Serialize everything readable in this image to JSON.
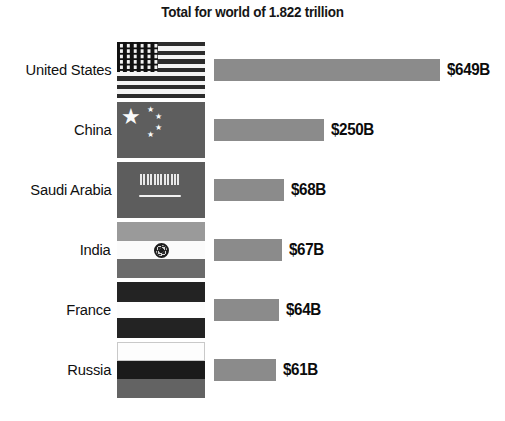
{
  "chart_data": {
    "type": "bar",
    "title": "Total for world of 1.822 trillion",
    "orientation": "horizontal",
    "xlabel": "",
    "ylabel": "",
    "grid": false,
    "legend": "none",
    "unit": "billions of USD",
    "xlim": [
      0,
      649
    ],
    "categories": [
      "United States",
      "China",
      "Saudi Arabia",
      "India",
      "France",
      "Russia"
    ],
    "values": [
      649,
      250,
      68,
      67,
      64,
      61
    ],
    "value_labels": [
      "$649B",
      "$250B",
      "$68B",
      "$67B",
      "$64B",
      "$61B"
    ]
  },
  "title": "Total for world of 1.822 trillion",
  "rows": [
    {
      "country": "United States",
      "value_label": "$649B",
      "value": 649,
      "bar_px": 226,
      "flag": "flag-us",
      "flag_name": "flag-united-states"
    },
    {
      "country": "China",
      "value_label": "$250B",
      "value": 250,
      "bar_px": 110,
      "flag": "flag-cn",
      "flag_name": "flag-china"
    },
    {
      "country": "Saudi Arabia",
      "value_label": "$68B",
      "value": 68,
      "bar_px": 70,
      "flag": "flag-sa",
      "flag_name": "flag-saudi-arabia"
    },
    {
      "country": "India",
      "value_label": "$67B",
      "value": 67,
      "bar_px": 68,
      "flag": "flag-in",
      "flag_name": "flag-india"
    },
    {
      "country": "France",
      "value_label": "$64B",
      "value": 64,
      "bar_px": 65,
      "flag": "flag-fr",
      "flag_name": "flag-france"
    },
    {
      "country": "Russia",
      "value_label": "$61B",
      "value": 61,
      "bar_px": 62,
      "flag": "flag-ru",
      "flag_name": "flag-russia"
    }
  ],
  "colors": {
    "background": "#ffffff",
    "bar": "#8b8b8b",
    "text": "#111111"
  }
}
